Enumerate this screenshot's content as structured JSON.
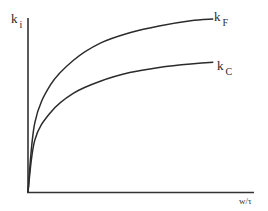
{
  "chart_data": {
    "type": "line",
    "title": "",
    "xlabel": "w/τ",
    "ylabel": "k_i",
    "ylabel_main": "k",
    "ylabel_sub": "i",
    "grid": false,
    "ticks": false,
    "legend_position": "inline-right",
    "note": "Qualitative schematic with no tick values. Coordinates are normalized estimates from pixel positions.",
    "xlim": [
      0,
      1
    ],
    "ylim": [
      0,
      1
    ],
    "series": [
      {
        "name": "k_F",
        "label_main": "k",
        "label_sub": "F",
        "x": [
          0.0,
          0.03,
          0.1,
          0.2,
          0.32,
          0.45,
          0.58,
          0.72,
          0.82
        ],
        "y": [
          0.0,
          0.4,
          0.62,
          0.76,
          0.86,
          0.92,
          0.96,
          0.99,
          1.0
        ]
      },
      {
        "name": "k_C",
        "label_main": "k",
        "label_sub": "C",
        "x": [
          0.0,
          0.03,
          0.1,
          0.2,
          0.32,
          0.45,
          0.58,
          0.72,
          0.82
        ],
        "y": [
          0.0,
          0.3,
          0.46,
          0.57,
          0.64,
          0.69,
          0.72,
          0.74,
          0.75
        ]
      }
    ]
  },
  "labels": {
    "y_axis_main": "k",
    "y_axis_sub": "i",
    "series_f_main": "k",
    "series_f_sub": "F",
    "series_c_main": "k",
    "series_c_sub": "C",
    "x_axis": "w/τ"
  },
  "colors": {
    "line": "#2b2b2b",
    "axis": "#333333",
    "background": "#ffffff"
  }
}
